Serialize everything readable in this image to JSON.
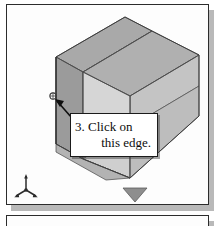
{
  "figure": {
    "kind": "cad-isometric-illustration",
    "background_color": "#ffffff",
    "panel": {
      "name": "cad-viewport-frame",
      "border_color": "#2c2c2c",
      "fill_color": "#fdfdfd",
      "shadow_color": "#b9b9b9"
    },
    "panel_below": {
      "name": "next-figure-frame",
      "border_color": "#2c2c2c",
      "fill_color": "#fdfdfd",
      "shadow_color": "#b9b9b9"
    }
  },
  "solid": {
    "name": "l-shaped-block",
    "shading": {
      "top_face": "#a9a9a9",
      "left_face": "#9b9b9b",
      "front_face": "#d4d4d4",
      "right_face": "#c2c2c2",
      "outline": "#4a4a4a"
    }
  },
  "callout": {
    "line1": "3. Click on",
    "line2": "this edge.",
    "border_color": "#1b1b1b",
    "fill_color": "#ffffff"
  },
  "leader": {
    "name": "leader-arrow",
    "color": "#111111",
    "target": "vertical-left-edge-of-upright-wall"
  },
  "cursor": {
    "name": "selection-cursor",
    "glyph": "edge-pick-cursor",
    "color": "#3a3a3a"
  },
  "axis_triad": {
    "name": "origin-axis-triad",
    "color": "#2b2b2b",
    "axes": [
      "x",
      "y",
      "z"
    ]
  }
}
